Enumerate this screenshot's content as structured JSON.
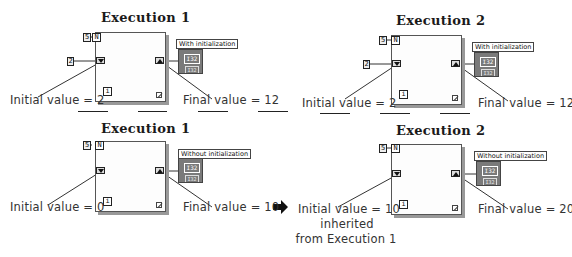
{
  "panels": [
    {
      "id": "top-left",
      "title": "Execution 1",
      "loop_count": "5",
      "count_terminal": "N",
      "initial_constant": "2",
      "iteration_terminal": "i",
      "indicator_label": "With initialization",
      "indicator_value": "I32",
      "indicator_type": "I32",
      "initial_note": "Initial value = 2",
      "final_note": "Final value = 12"
    },
    {
      "id": "top-right",
      "title": "Execution 2",
      "loop_count": "5",
      "count_terminal": "N",
      "initial_constant": "2",
      "iteration_terminal": "i",
      "indicator_label": "With initialization",
      "indicator_value": "I32",
      "indicator_type": "I32",
      "initial_note": "Initial value = 2",
      "final_note": "Final value = 12"
    },
    {
      "id": "bottom-left",
      "title": "Execution 1",
      "loop_count": "5",
      "count_terminal": "N",
      "iteration_terminal": "i",
      "indicator_label": "Without initialization",
      "indicator_value": "I32",
      "indicator_type": "I32",
      "initial_note": "Initial value = 0",
      "final_note": "Final value = 10"
    },
    {
      "id": "bottom-right",
      "title": "Execution 2",
      "loop_count": "5",
      "count_terminal": "N",
      "iteration_terminal": "i",
      "indicator_label": "Without initialization",
      "indicator_value": "I32",
      "indicator_type": "I32",
      "initial_note": "Initial value = 10",
      "initial_note_line2": "inherited",
      "initial_note_line3": "from Execution 1",
      "final_note": "Final value = 20"
    }
  ],
  "icons": {
    "arrow": "right-arrow-icon",
    "add": "add-node-icon",
    "shift_left": "shift-register-down-icon",
    "shift_right": "shift-register-up-icon"
  },
  "colors": {
    "indicator_fill": "#7a7a7a",
    "wire": "#333333",
    "loop_border": "#555555"
  }
}
